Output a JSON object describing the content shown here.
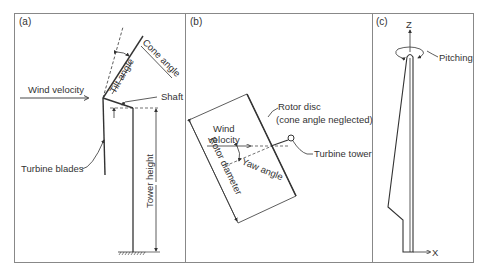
{
  "panels": {
    "a": {
      "tag": "(a)",
      "labels": {
        "wind_velocity": "Wind velocity",
        "cone_angle": "Cone angle",
        "tilt_angle": "Tilt angle",
        "shaft": "Shaft",
        "turbine_blades": "Turbine blades",
        "tower_height": "Tower height"
      }
    },
    "b": {
      "tag": "(b)",
      "labels": {
        "rotor_disc": "Rotor disc",
        "rotor_disc_note": "(cone angle neglected)",
        "wind": "Wind",
        "velocity": "velocity",
        "turbine_tower": "Turbine tower",
        "yaw_angle": "Yaw angle",
        "rotor_diameter": "Rotor diameter"
      }
    },
    "c": {
      "tag": "(c)",
      "labels": {
        "z_axis": "Z",
        "x_axis": "X",
        "pitching": "Pitching"
      }
    }
  },
  "colors": {
    "line": "#333333",
    "frame": "#888888",
    "background": "#ffffff"
  }
}
